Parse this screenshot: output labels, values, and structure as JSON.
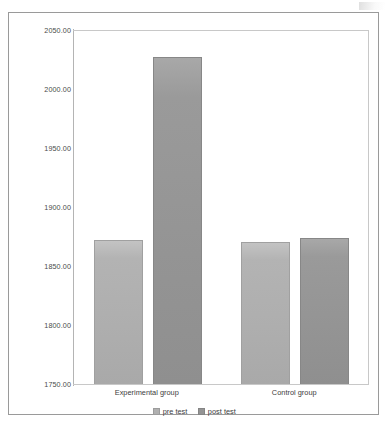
{
  "chart_data": {
    "type": "bar",
    "title": "",
    "xlabel": "",
    "ylabel": "",
    "categories": [
      "Experimental group",
      "Control group"
    ],
    "series": [
      {
        "name": "pre test",
        "values": [
          1872,
          1870
        ]
      },
      {
        "name": "post test",
        "values": [
          2027,
          1874
        ]
      }
    ],
    "ylim": [
      1750,
      2050
    ],
    "ytick_step": 50,
    "yticks": [
      "1750.00",
      "1800.00",
      "1850.00",
      "1900.00",
      "1950.00",
      "2000.00",
      "2050.00"
    ],
    "ytick_values": [
      1750,
      1800,
      1850,
      1900,
      1950,
      2000,
      2050
    ],
    "grid": false,
    "legend_position": "bottom",
    "colors": {
      "pre_test": "#b0b0b0",
      "post_test": "#949494",
      "axis": "#b4b4b4",
      "frame": "#9a9a9a",
      "text": "#3c3c3c"
    }
  }
}
